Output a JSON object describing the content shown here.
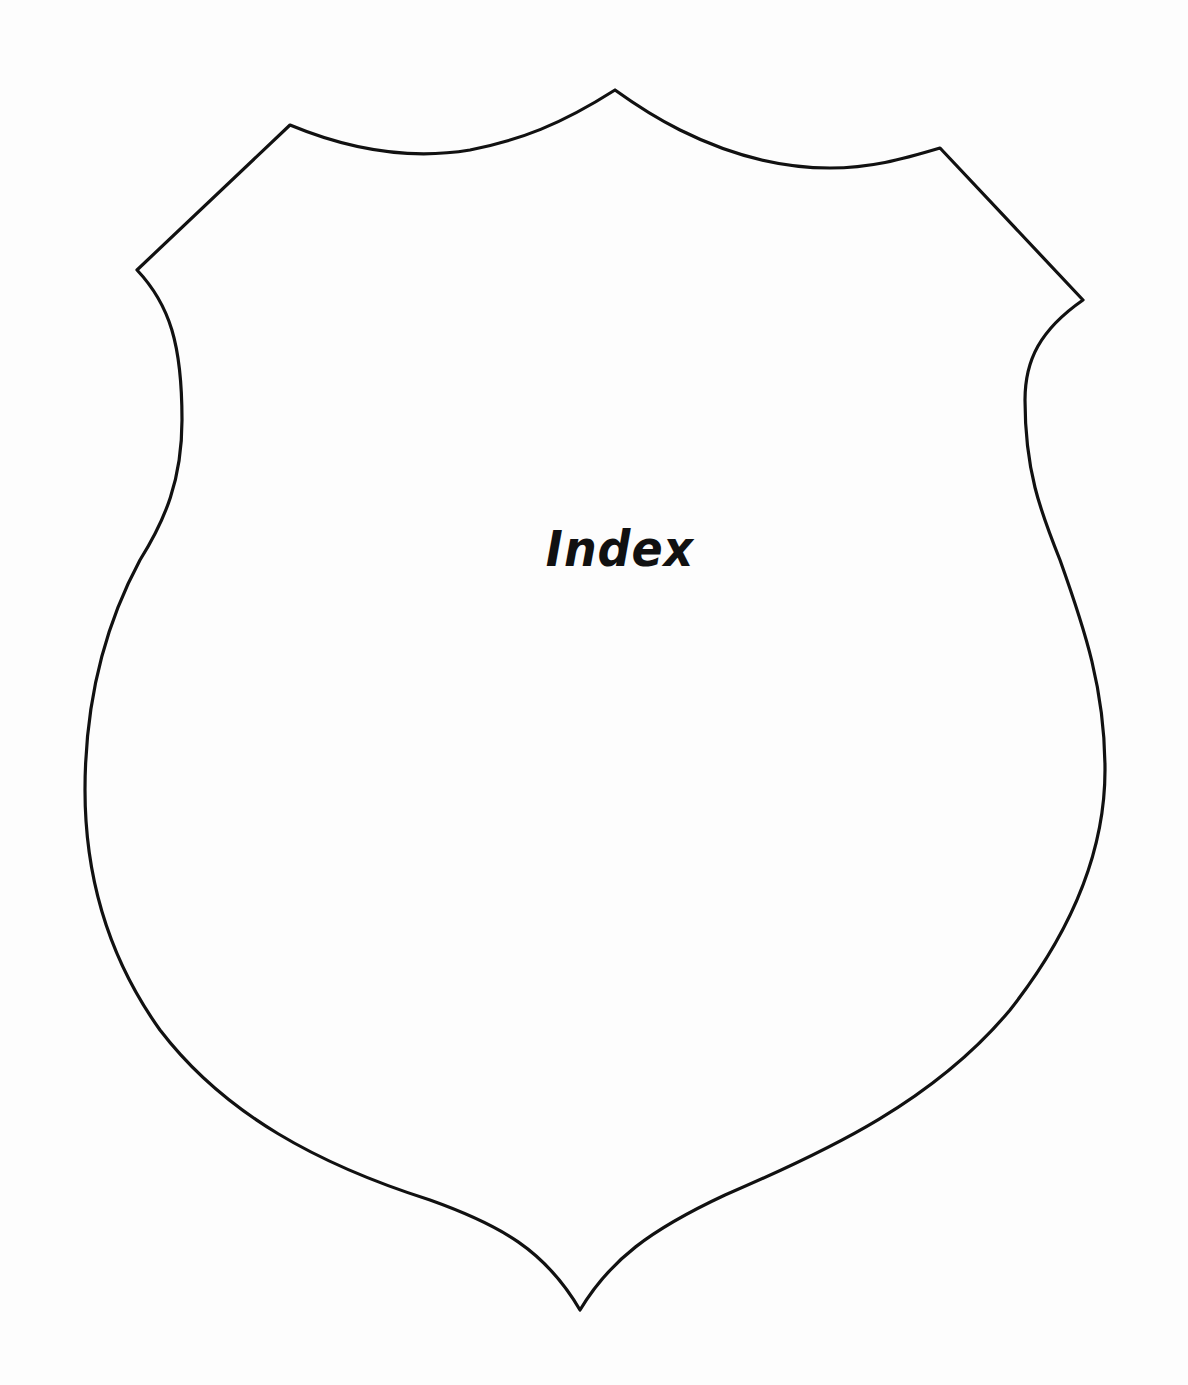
{
  "page": {
    "title": "Index",
    "background_color": "#fdfdfd",
    "outline_color": "#111111",
    "emblem": "shield-outline"
  }
}
